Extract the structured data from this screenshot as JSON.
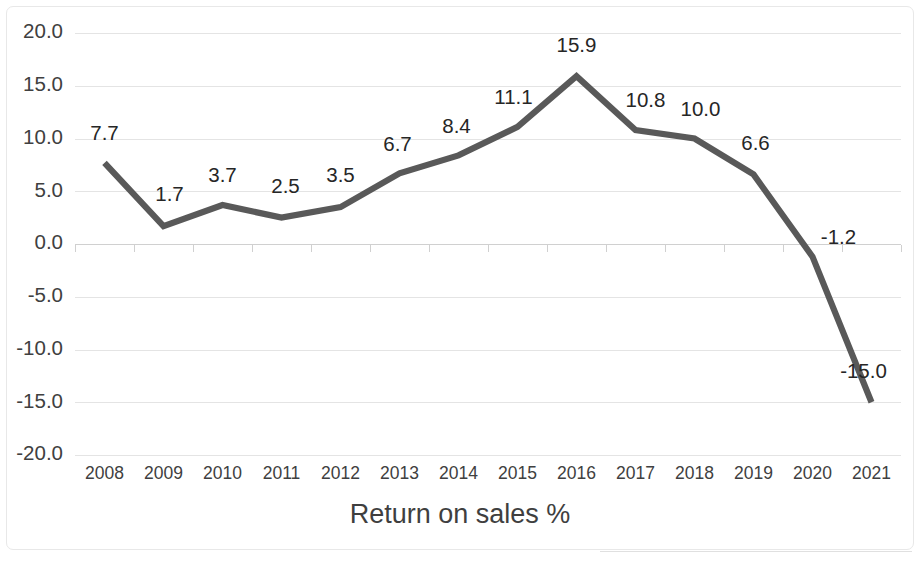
{
  "chart_data": {
    "type": "line",
    "title": "Return on sales %",
    "xlabel": "Return on sales %",
    "ylabel": "",
    "categories": [
      "2008",
      "2009",
      "2010",
      "2011",
      "2012",
      "2013",
      "2014",
      "2015",
      "2016",
      "2017",
      "2018",
      "2019",
      "2020",
      "2021"
    ],
    "values": [
      7.7,
      1.7,
      3.7,
      2.5,
      3.5,
      6.7,
      8.4,
      11.1,
      15.9,
      10.8,
      10.0,
      6.6,
      -1.2,
      -15.0
    ],
    "data_labels": [
      "7.7",
      "1.7",
      "3.7",
      "2.5",
      "3.5",
      "6.7",
      "8.4",
      "11.1",
      "15.9",
      "10.8",
      "10.0",
      "6.6",
      "-1.2",
      "-15.0"
    ],
    "ylim": [
      -20.0,
      20.0
    ],
    "ytick_values": [
      20.0,
      15.0,
      10.0,
      5.0,
      0.0,
      -5.0,
      -10.0,
      -15.0,
      -20.0
    ],
    "ytick_labels": [
      "20.0",
      "15.0",
      "10.0",
      "5.0",
      "0.0",
      "-5.0",
      "-10.0",
      "-15.0",
      "-20.0"
    ],
    "grid": true,
    "legend": false,
    "series_name": "Return on sales %",
    "line_color": "#595959",
    "grid_color": "#e4e4e4",
    "axis_color": "#d0d0d0",
    "text_color": "#404040",
    "data_label_color": "#262626",
    "background_color": "#ffffff"
  },
  "label_offsets": [
    {
      "dx": 0,
      "dy": -28
    },
    {
      "dx": 6,
      "dy": -30
    },
    {
      "dx": 0,
      "dy": -28
    },
    {
      "dx": 4,
      "dy": -30
    },
    {
      "dx": 0,
      "dy": -30
    },
    {
      "dx": -2,
      "dy": -28
    },
    {
      "dx": -2,
      "dy": -28
    },
    {
      "dx": -4,
      "dy": -28
    },
    {
      "dx": 0,
      "dy": -30
    },
    {
      "dx": 10,
      "dy": -28
    },
    {
      "dx": 6,
      "dy": -28
    },
    {
      "dx": 2,
      "dy": -30
    },
    {
      "dx": 26,
      "dy": -18
    },
    {
      "dx": -8,
      "dy": -30
    }
  ]
}
